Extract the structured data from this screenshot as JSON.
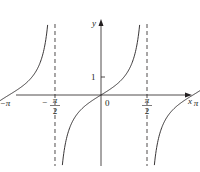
{
  "chart_data": {
    "type": "line",
    "title": "",
    "function": "y = tan x",
    "xlabel": "x",
    "ylabel": "y",
    "origin_label": "0",
    "x_ticks": [
      {
        "value": -4.712,
        "label": "-3π/2",
        "num": "3π",
        "den": "2",
        "neg": true
      },
      {
        "value": -3.1416,
        "label": "-π",
        "num": "π",
        "den": "",
        "neg": true
      },
      {
        "value": -1.5708,
        "label": "-π/2",
        "num": "π",
        "den": "2",
        "neg": true
      },
      {
        "value": 1.5708,
        "label": "π/2",
        "num": "π",
        "den": "2",
        "neg": false
      },
      {
        "value": 3.1416,
        "label": "π",
        "num": "π",
        "den": "",
        "neg": false
      },
      {
        "value": 4.712,
        "label": "3π/2",
        "num": "3π",
        "den": "2",
        "neg": false
      }
    ],
    "y_ticks": [
      {
        "value": 1,
        "label": "1"
      }
    ],
    "asymptotes": [
      -4.712,
      -1.5708,
      1.5708,
      4.712
    ],
    "xlim": [
      -5.5,
      5.5
    ],
    "ylim": [
      -7,
      4.5
    ],
    "grid": false,
    "legend": null,
    "colors": {
      "curve": "#231f20",
      "axis": "#231f20",
      "asymptote": "#231f20"
    }
  }
}
